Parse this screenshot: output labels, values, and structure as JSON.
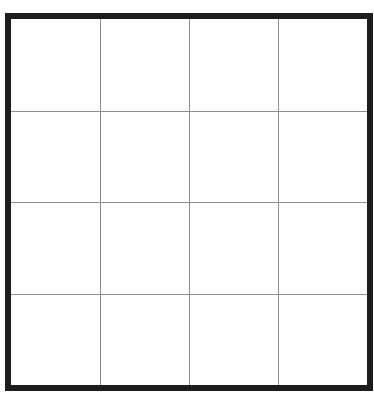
{
  "grid": {
    "rows": 4,
    "cols": 4,
    "cell_count": 16,
    "frame_border_color": "#1c1c1c",
    "frame_border_px": 6,
    "line_color": "#8f8f8f",
    "line_px": 1,
    "cell_background": "#ffffff",
    "page_background": "#ffffff"
  }
}
